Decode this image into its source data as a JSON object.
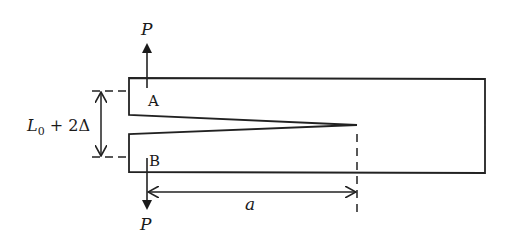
{
  "diagram": {
    "type": "double cantilever beam specimen",
    "labels": {
      "force_top": "P",
      "force_bottom": "P",
      "point_top": "A",
      "point_bottom": "B",
      "opening_symbol": "L",
      "opening_subscript": "0",
      "opening_rest": " + 2Δ",
      "crack_length": "a"
    },
    "colors": {
      "line": "#222222",
      "background": "#ffffff",
      "text": "#1a1a1a"
    }
  }
}
